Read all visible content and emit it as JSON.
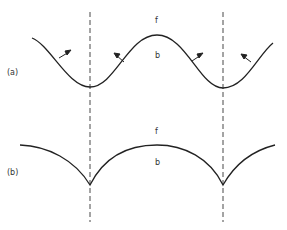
{
  "figure": {
    "panel_a": {
      "label": "(a)",
      "upper_region_label": "f",
      "lower_region_label": "b"
    },
    "panel_b": {
      "label": "(b)",
      "upper_region_label": "f",
      "lower_region_label": "b"
    },
    "colors": {
      "stroke": "#222222",
      "background": "#ffffff"
    }
  }
}
